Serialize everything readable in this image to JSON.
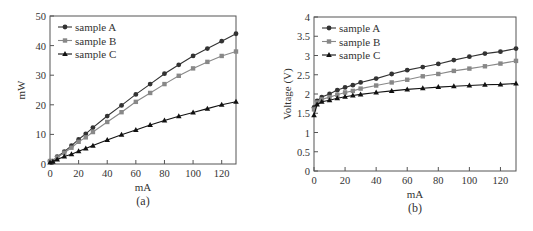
{
  "chart_data": [
    {
      "type": "line",
      "panel_label": "(a)",
      "title": "",
      "xlabel": "mA",
      "ylabel": "mW",
      "xlim": [
        0,
        130
      ],
      "ylim": [
        0,
        50
      ],
      "xticks": [
        0,
        20,
        40,
        60,
        80,
        100,
        120
      ],
      "yticks": [
        0,
        10,
        20,
        30,
        40,
        50
      ],
      "grid": false,
      "legend_position": "upper left",
      "x": [
        0,
        2,
        5,
        10,
        15,
        20,
        25,
        30,
        40,
        50,
        60,
        70,
        80,
        90,
        100,
        110,
        120,
        130
      ],
      "series": [
        {
          "name": "sample A",
          "marker": "circle",
          "color": "#333333",
          "values": [
            1,
            1,
            2.5,
            4.2,
            6.2,
            8.3,
            10.2,
            12.3,
            16.2,
            19.8,
            23.5,
            27,
            30.5,
            33.5,
            36.5,
            39,
            41.5,
            44
          ]
        },
        {
          "name": "sample B",
          "marker": "square",
          "color": "#888888",
          "values": [
            1,
            1,
            2.2,
            3.8,
            5.5,
            7.5,
            9,
            10.8,
            14.2,
            17.5,
            21,
            24,
            27,
            29.8,
            32.3,
            34.5,
            36.5,
            38
          ]
        },
        {
          "name": "sample C",
          "marker": "triangle",
          "color": "#111111",
          "values": [
            0.5,
            0.8,
            1.5,
            2.5,
            3.3,
            4.3,
            5.2,
            6.2,
            8.1,
            9.9,
            11.5,
            13.2,
            14.7,
            16.1,
            17.4,
            18.7,
            20,
            21
          ]
        }
      ]
    },
    {
      "type": "line",
      "panel_label": "(b)",
      "title": "",
      "xlabel": "mA",
      "ylabel": "Voltage (V)",
      "xlim": [
        0,
        130
      ],
      "ylim": [
        0,
        4
      ],
      "xticks": [
        0,
        20,
        40,
        60,
        80,
        100,
        120
      ],
      "yticks": [
        0,
        0.5,
        1,
        1.5,
        2,
        2.5,
        3,
        3.5,
        4
      ],
      "grid": false,
      "legend_position": "upper left",
      "x": [
        0,
        2,
        5,
        10,
        15,
        20,
        25,
        30,
        40,
        50,
        60,
        70,
        80,
        90,
        100,
        110,
        120,
        130
      ],
      "series": [
        {
          "name": "sample A",
          "marker": "circle",
          "color": "#333333",
          "values": [
            1.65,
            1.82,
            1.92,
            2.0,
            2.1,
            2.17,
            2.23,
            2.3,
            2.4,
            2.52,
            2.62,
            2.7,
            2.78,
            2.88,
            2.97,
            3.05,
            3.1,
            3.18
          ]
        },
        {
          "name": "sample B",
          "marker": "square",
          "color": "#888888",
          "values": [
            1.6,
            1.78,
            1.86,
            1.92,
            1.98,
            2.04,
            2.08,
            2.14,
            2.22,
            2.3,
            2.37,
            2.46,
            2.52,
            2.6,
            2.66,
            2.72,
            2.79,
            2.86
          ]
        },
        {
          "name": "sample C",
          "marker": "triangle",
          "color": "#111111",
          "values": [
            1.45,
            1.73,
            1.8,
            1.84,
            1.89,
            1.93,
            1.96,
            1.99,
            2.04,
            2.08,
            2.12,
            2.15,
            2.18,
            2.2,
            2.22,
            2.24,
            2.25,
            2.27
          ]
        }
      ]
    }
  ],
  "layout": {
    "panels": [
      {
        "left": 50,
        "right": 236,
        "top": 16,
        "bottom": 164
      },
      {
        "left": 314,
        "right": 516,
        "top": 17,
        "bottom": 171
      }
    ]
  }
}
